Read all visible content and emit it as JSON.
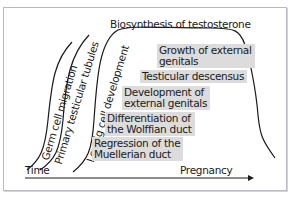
{
  "diagram": {
    "title": "Biosynthesis of testosterone",
    "axis": {
      "x_label_left": "Time",
      "x_label_right": "Pregnancy"
    },
    "curves": [
      {
        "label": "Germ cell migration"
      },
      {
        "label": "Primary testicular tubules"
      },
      {
        "label": "Leydig cell development"
      }
    ],
    "events": [
      {
        "line1": "Growth of external",
        "line2": "genitals"
      },
      {
        "line1": "Testicular descensus",
        "line2": ""
      },
      {
        "line1": "Development of",
        "line2": "external genitals"
      },
      {
        "line1": "Differentiation of",
        "line2": "the Wolffian duct"
      },
      {
        "line1": "Regression of the",
        "line2": "Muellerian duct"
      }
    ],
    "colors": {
      "box_fill": "#dcdcdc",
      "line": "#1a1a1a",
      "frame": "#b9b9c4"
    }
  }
}
